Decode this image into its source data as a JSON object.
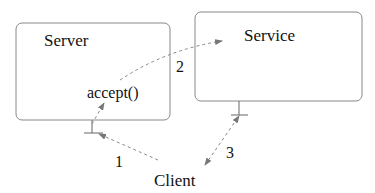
{
  "diagram": {
    "nodes": {
      "server": {
        "label": "Server",
        "method": "accept()"
      },
      "service": {
        "label": "Service"
      },
      "client": {
        "label": "Client"
      }
    },
    "edges": [
      {
        "label": "1",
        "from": "Client",
        "to": "Server"
      },
      {
        "label": "2",
        "from": "Server accept()",
        "to": "Service"
      },
      {
        "label": "3",
        "from": "Client",
        "to": "Service",
        "bidirectional": true
      }
    ],
    "colors": {
      "box_stroke": "#888888",
      "arrow_stroke": "#888888",
      "text": "#111111"
    }
  }
}
